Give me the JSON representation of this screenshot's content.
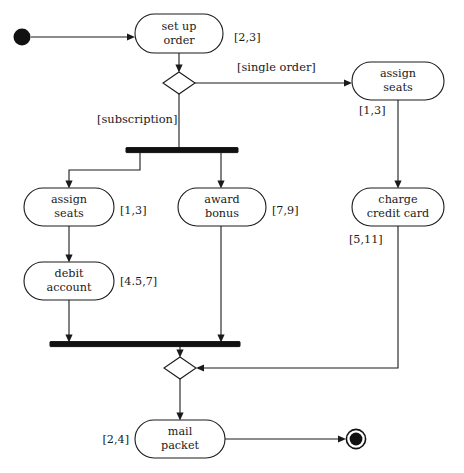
{
  "diagram": {
    "type": "uml-activity-diagram",
    "title": "",
    "start_node": {
      "name": "initial-node",
      "shape": "filled-circle",
      "cx": 22,
      "cy": 37,
      "r": 8.5
    },
    "end_node": {
      "name": "final-node",
      "shape": "bullseye",
      "cx": 356,
      "cy": 439,
      "r_outer": 10,
      "r_inner": 6.5
    },
    "activities": [
      {
        "id": "set-up-order",
        "label_line1": "set up",
        "label_line2": "order",
        "duration": "[2,3]",
        "duration_position": "right",
        "x": 135,
        "y": 14,
        "w": 88,
        "h": 39
      },
      {
        "id": "assign-seats-single",
        "label_line1": "assign",
        "label_line2": "seats",
        "duration": "[1,3]",
        "duration_position": "below-left",
        "x": 352,
        "y": 62,
        "w": 92,
        "h": 38
      },
      {
        "id": "assign-seats-sub",
        "label_line1": "assign",
        "label_line2": "seats",
        "duration": "[1,3]",
        "duration_position": "right",
        "x": 24,
        "y": 188,
        "w": 90,
        "h": 38
      },
      {
        "id": "award-bonus",
        "label_line1": "award",
        "label_line2": "bonus",
        "duration": "[7,9]",
        "duration_position": "right",
        "x": 178,
        "y": 188,
        "w": 88,
        "h": 38
      },
      {
        "id": "charge-credit-card",
        "label_line1": "charge",
        "label_line2": "credit card",
        "duration": "[5,11]",
        "duration_position": "below-left",
        "x": 352,
        "y": 188,
        "w": 92,
        "h": 38
      },
      {
        "id": "debit-account",
        "label_line1": "debit",
        "label_line2": "account",
        "duration": "[4.5,7]",
        "duration_position": "right",
        "x": 24,
        "y": 262,
        "w": 90,
        "h": 38
      },
      {
        "id": "mail-packet",
        "label_line1": "mail",
        "label_line2": "packet",
        "duration": "[2,4]",
        "duration_position": "left",
        "x": 135,
        "y": 420,
        "w": 90,
        "h": 38
      }
    ],
    "decisions": [
      {
        "id": "branch-decision",
        "cx": 179,
        "cy": 83,
        "rx": 16,
        "ry": 11
      },
      {
        "id": "merge-decision",
        "cx": 180,
        "cy": 368,
        "rx": 16,
        "ry": 11
      }
    ],
    "bars": [
      {
        "id": "fork-bar",
        "x1": 126,
        "x2": 238,
        "y": 150,
        "thickness": 5
      },
      {
        "id": "join-bar",
        "x1": 50,
        "x2": 240,
        "y": 344,
        "thickness": 5
      }
    ],
    "guards": [
      {
        "id": "guard-single-order",
        "text": "[single order]",
        "x": 237,
        "y": 68,
        "anchor": "start"
      },
      {
        "id": "guard-subscription",
        "text": "[subscription]",
        "x": 97,
        "y": 120,
        "anchor": "start"
      }
    ],
    "durations_rendered": [
      {
        "id": "dur-set-up-order",
        "text": "[2,3]",
        "x": 234,
        "y": 38,
        "anchor": "start"
      },
      {
        "id": "dur-assign-seats-single",
        "text": "[1,3]",
        "x": 359,
        "y": 111,
        "anchor": "start"
      },
      {
        "id": "dur-assign-seats-sub",
        "text": "[1,3]",
        "x": 120,
        "y": 211,
        "anchor": "start"
      },
      {
        "id": "dur-award-bonus",
        "text": "[7,9]",
        "x": 272,
        "y": 211,
        "anchor": "start"
      },
      {
        "id": "dur-charge-credit-card",
        "text": "[5,11]",
        "x": 349,
        "y": 240,
        "anchor": "start"
      },
      {
        "id": "dur-debit-account",
        "text": "[4.5,7]",
        "x": 120,
        "y": 282,
        "anchor": "start"
      },
      {
        "id": "dur-mail-packet",
        "text": "[2,4]",
        "x": 129,
        "y": 440,
        "anchor": "end"
      }
    ],
    "colors": {
      "ink": "#1a1a1a",
      "fill": "#ffffff",
      "bar": "#111111"
    }
  }
}
